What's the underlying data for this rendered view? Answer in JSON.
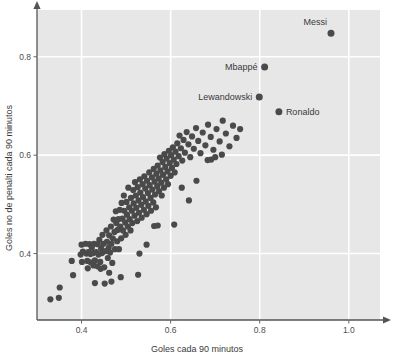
{
  "chart_data": {
    "type": "scatter",
    "title": "",
    "xlabel": "Goles cada 90 minutos",
    "ylabel": "Goles no de penalti cada 90 minutos",
    "xlim": [
      0.3,
      1.07
    ],
    "ylim": [
      0.265,
      0.895
    ],
    "xticks": [
      0.4,
      0.6,
      0.8,
      1.0
    ],
    "xticklabels": [
      "0.4",
      "0.6",
      "0.8",
      "1.0"
    ],
    "yticks": [
      0.4,
      0.6,
      0.8
    ],
    "yticklabels": [
      "0.4",
      "0.6",
      "0.8"
    ],
    "grid": true,
    "grid_color": "#ffffff",
    "plot_bgcolor": "#e7e7e7",
    "point_color": "#4a4a4a",
    "point_size": 3.1,
    "legend": "none",
    "annotations": [
      {
        "label": "Messi",
        "x": 0.96,
        "y": 0.848,
        "label_dx": -4,
        "label_dy": -8,
        "anchor": "end"
      },
      {
        "label": "Mbappé",
        "x": 0.811,
        "y": 0.779,
        "label_dx": -7,
        "label_dy": 3,
        "anchor": "end"
      },
      {
        "label": "Lewandowski",
        "x": 0.799,
        "y": 0.718,
        "label_dx": -7,
        "label_dy": 3,
        "anchor": "end"
      },
      {
        "label": "Ronaldo",
        "x": 0.843,
        "y": 0.688,
        "label_dx": 7,
        "label_dy": 3,
        "anchor": "start"
      }
    ],
    "points": [
      [
        0.33,
        0.307
      ],
      [
        0.349,
        0.31
      ],
      [
        0.351,
        0.331
      ],
      [
        0.378,
        0.385
      ],
      [
        0.381,
        0.356
      ],
      [
        0.398,
        0.398
      ],
      [
        0.4,
        0.418
      ],
      [
        0.401,
        0.383
      ],
      [
        0.403,
        0.404
      ],
      [
        0.409,
        0.42
      ],
      [
        0.411,
        0.4
      ],
      [
        0.413,
        0.385
      ],
      [
        0.415,
        0.403
      ],
      [
        0.418,
        0.419
      ],
      [
        0.42,
        0.399
      ],
      [
        0.421,
        0.382
      ],
      [
        0.423,
        0.412
      ],
      [
        0.426,
        0.401
      ],
      [
        0.428,
        0.42
      ],
      [
        0.43,
        0.386
      ],
      [
        0.43,
        0.34
      ],
      [
        0.433,
        0.403
      ],
      [
        0.436,
        0.419
      ],
      [
        0.438,
        0.398
      ],
      [
        0.44,
        0.428
      ],
      [
        0.442,
        0.383
      ],
      [
        0.444,
        0.411
      ],
      [
        0.446,
        0.401
      ],
      [
        0.447,
        0.438
      ],
      [
        0.449,
        0.42
      ],
      [
        0.451,
        0.372
      ],
      [
        0.452,
        0.339
      ],
      [
        0.454,
        0.405
      ],
      [
        0.456,
        0.447
      ],
      [
        0.457,
        0.424
      ],
      [
        0.459,
        0.391
      ],
      [
        0.461,
        0.412
      ],
      [
        0.462,
        0.437
      ],
      [
        0.464,
        0.402
      ],
      [
        0.466,
        0.455
      ],
      [
        0.467,
        0.42
      ],
      [
        0.469,
        0.381
      ],
      [
        0.47,
        0.431
      ],
      [
        0.472,
        0.469
      ],
      [
        0.474,
        0.444
      ],
      [
        0.475,
        0.409
      ],
      [
        0.477,
        0.486
      ],
      [
        0.478,
        0.462
      ],
      [
        0.48,
        0.425
      ],
      [
        0.481,
        0.448
      ],
      [
        0.483,
        0.47
      ],
      [
        0.484,
        0.409
      ],
      [
        0.486,
        0.489
      ],
      [
        0.487,
        0.455
      ],
      [
        0.489,
        0.431
      ],
      [
        0.49,
        0.503
      ],
      [
        0.492,
        0.471
      ],
      [
        0.493,
        0.447
      ],
      [
        0.495,
        0.518
      ],
      [
        0.496,
        0.487
      ],
      [
        0.498,
        0.463
      ],
      [
        0.499,
        0.438
      ],
      [
        0.501,
        0.505
      ],
      [
        0.502,
        0.479
      ],
      [
        0.504,
        0.455
      ],
      [
        0.505,
        0.534
      ],
      [
        0.507,
        0.494
      ],
      [
        0.508,
        0.47
      ],
      [
        0.51,
        0.447
      ],
      [
        0.511,
        0.513
      ],
      [
        0.513,
        0.487
      ],
      [
        0.514,
        0.462
      ],
      [
        0.516,
        0.529
      ],
      [
        0.517,
        0.502
      ],
      [
        0.519,
        0.477
      ],
      [
        0.52,
        0.545
      ],
      [
        0.522,
        0.518
      ],
      [
        0.523,
        0.493
      ],
      [
        0.525,
        0.466
      ],
      [
        0.526,
        0.535
      ],
      [
        0.528,
        0.508
      ],
      [
        0.529,
        0.483
      ],
      [
        0.531,
        0.551
      ],
      [
        0.532,
        0.524
      ],
      [
        0.534,
        0.499
      ],
      [
        0.535,
        0.473
      ],
      [
        0.537,
        0.541
      ],
      [
        0.538,
        0.515
      ],
      [
        0.54,
        0.489
      ],
      [
        0.541,
        0.557
      ],
      [
        0.543,
        0.532
      ],
      [
        0.544,
        0.506
      ],
      [
        0.546,
        0.48
      ],
      [
        0.547,
        0.548
      ],
      [
        0.549,
        0.523
      ],
      [
        0.55,
        0.497
      ],
      [
        0.552,
        0.565
      ],
      [
        0.553,
        0.539
      ],
      [
        0.555,
        0.513
      ],
      [
        0.556,
        0.487
      ],
      [
        0.558,
        0.555
      ],
      [
        0.559,
        0.53
      ],
      [
        0.561,
        0.504
      ],
      [
        0.562,
        0.572
      ],
      [
        0.564,
        0.546
      ],
      [
        0.565,
        0.52
      ],
      [
        0.567,
        0.494
      ],
      [
        0.568,
        0.562
      ],
      [
        0.57,
        0.537
      ],
      [
        0.571,
        0.579
      ],
      [
        0.573,
        0.553
      ],
      [
        0.574,
        0.527
      ],
      [
        0.576,
        0.595
      ],
      [
        0.577,
        0.569
      ],
      [
        0.579,
        0.544
      ],
      [
        0.58,
        0.518
      ],
      [
        0.582,
        0.586
      ],
      [
        0.583,
        0.56
      ],
      [
        0.585,
        0.534
      ],
      [
        0.586,
        0.602
      ],
      [
        0.588,
        0.576
      ],
      [
        0.59,
        0.551
      ],
      [
        0.591,
        0.593
      ],
      [
        0.593,
        0.567
      ],
      [
        0.594,
        0.541
      ],
      [
        0.596,
        0.609
      ],
      [
        0.598,
        0.584
      ],
      [
        0.6,
        0.558
      ],
      [
        0.601,
        0.6
      ],
      [
        0.603,
        0.574
      ],
      [
        0.605,
        0.616
      ],
      [
        0.607,
        0.591
      ],
      [
        0.609,
        0.565
      ],
      [
        0.611,
        0.607
      ],
      [
        0.613,
        0.582
      ],
      [
        0.615,
        0.624
      ],
      [
        0.618,
        0.598
      ],
      [
        0.62,
        0.64
      ],
      [
        0.623,
        0.614
      ],
      [
        0.626,
        0.589
      ],
      [
        0.629,
        0.631
      ],
      [
        0.632,
        0.605
      ],
      [
        0.636,
        0.647
      ],
      [
        0.64,
        0.622
      ],
      [
        0.644,
        0.596
      ],
      [
        0.648,
        0.638
      ],
      [
        0.652,
        0.613
      ],
      [
        0.657,
        0.655
      ],
      [
        0.662,
        0.629
      ],
      [
        0.667,
        0.604
      ],
      [
        0.672,
        0.646
      ],
      [
        0.678,
        0.62
      ],
      [
        0.684,
        0.662
      ],
      [
        0.69,
        0.637
      ],
      [
        0.696,
        0.611
      ],
      [
        0.703,
        0.653
      ],
      [
        0.71,
        0.628
      ],
      [
        0.717,
        0.67
      ],
      [
        0.724,
        0.644
      ],
      [
        0.732,
        0.618
      ],
      [
        0.74,
        0.66
      ],
      [
        0.748,
        0.635
      ],
      [
        0.756,
        0.653
      ],
      [
        0.488,
        0.352
      ],
      [
        0.527,
        0.357
      ],
      [
        0.53,
        0.4
      ],
      [
        0.546,
        0.418
      ],
      [
        0.563,
        0.456
      ],
      [
        0.571,
        0.457
      ],
      [
        0.608,
        0.459
      ],
      [
        0.625,
        0.534
      ],
      [
        0.641,
        0.508
      ],
      [
        0.658,
        0.548
      ],
      [
        0.683,
        0.59
      ],
      [
        0.691,
        0.591
      ],
      [
        0.7,
        0.596
      ],
      [
        0.715,
        0.601
      ],
      [
        0.462,
        0.361
      ],
      [
        0.467,
        0.343
      ],
      [
        0.443,
        0.369
      ],
      [
        0.436,
        0.374
      ],
      [
        0.414,
        0.37
      ],
      [
        0.427,
        0.376
      ]
    ]
  }
}
